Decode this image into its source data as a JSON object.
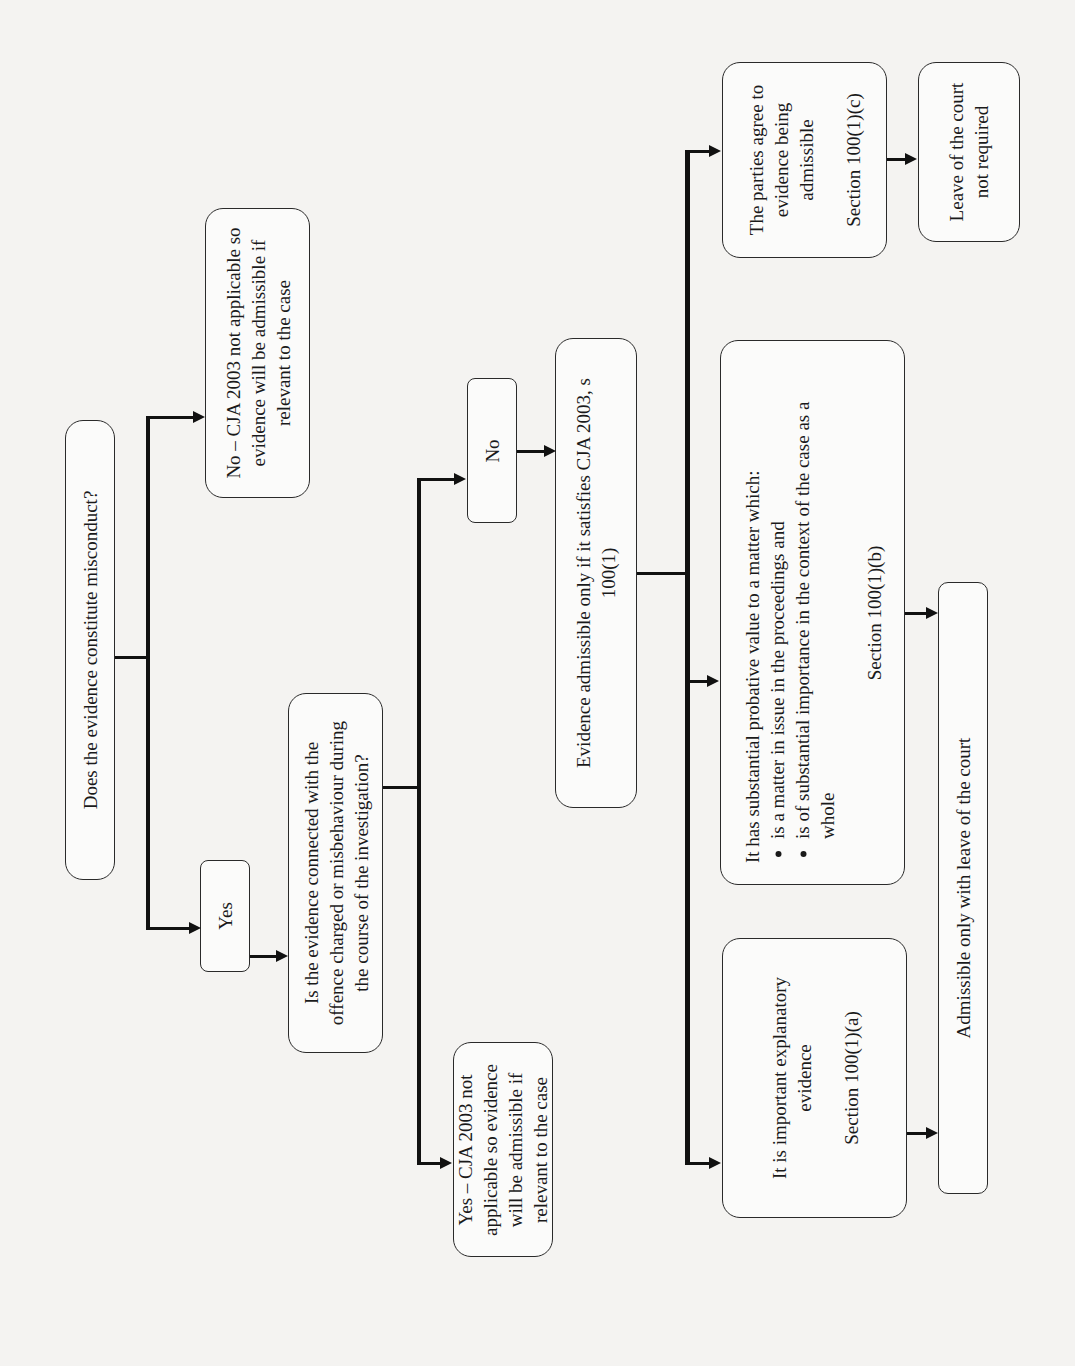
{
  "diagram": {
    "orientation": "rotated -90deg (reads bottom-to-top)",
    "nodes": {
      "q1": {
        "label": "Does the evidence constitute misconduct?"
      },
      "q1_no": {
        "label": "No – CJA 2003 not applicable so evidence will be admissible if relevant to the case"
      },
      "q1_yes": {
        "label": "Yes"
      },
      "q2": {
        "label": "Is the evidence connected with the offence charged or misbehaviour during the course of the investigation?"
      },
      "q2_yes": {
        "label": "Yes – CJA 2003 not applicable so evidence will be admissible if relevant to the case"
      },
      "q2_no": {
        "label": "No"
      },
      "s100": {
        "label": "Evidence admissible only if it satisfies CJA 2003, s 100(1)"
      },
      "opt_a": {
        "label": "It is important explanatory evidence",
        "section": "Section 100(1)(a)"
      },
      "opt_b": {
        "label": "It has substantial probative value to a matter which:",
        "bullets": [
          "is a matter in issue in the proceedings and",
          "is of substantial importance in the context of the case as a whole"
        ],
        "section": "Section 100(1)(b)"
      },
      "opt_c": {
        "label": "The parties agree to evidence being admissible",
        "section": "Section 100(1)(c)"
      },
      "leave_required": {
        "label": "Admissible only with leave of the court"
      },
      "leave_not_required": {
        "label": "Leave of the court not required"
      }
    },
    "edges": [
      {
        "from": "q1",
        "to": "q1_no"
      },
      {
        "from": "q1",
        "to": "q1_yes"
      },
      {
        "from": "q1_yes",
        "to": "q2"
      },
      {
        "from": "q2",
        "to": "q2_yes"
      },
      {
        "from": "q2",
        "to": "q2_no"
      },
      {
        "from": "q2_no",
        "to": "s100"
      },
      {
        "from": "s100",
        "to": "opt_a"
      },
      {
        "from": "s100",
        "to": "opt_b"
      },
      {
        "from": "s100",
        "to": "opt_c"
      },
      {
        "from": "opt_a",
        "to": "leave_required"
      },
      {
        "from": "opt_b",
        "to": "leave_required"
      },
      {
        "from": "opt_c",
        "to": "leave_not_required"
      }
    ]
  }
}
